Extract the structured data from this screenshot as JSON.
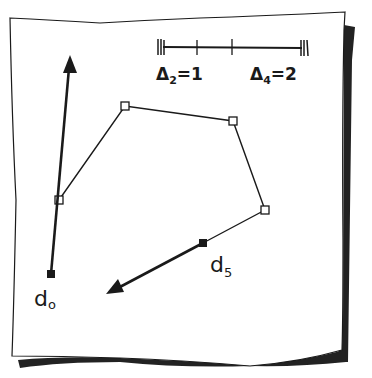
{
  "colors": {
    "ink": "#1a1a1a",
    "paper": "#ffffff",
    "shadow": "#222222"
  },
  "scale_bar": {
    "labels": [
      {
        "id": "delta2",
        "symbol": "Δ",
        "sub": "2",
        "eq": "=1",
        "x": 158,
        "y": 76
      },
      {
        "id": "delta4",
        "symbol": "Δ",
        "sub": "4",
        "eq": "=2",
        "x": 250,
        "y": 76
      }
    ],
    "x_start": 163,
    "x_end": 302,
    "y": 47,
    "ticks": [
      197,
      231
    ]
  },
  "polyline": {
    "control_points": [
      {
        "x": 59,
        "y": 200
      },
      {
        "x": 125,
        "y": 106
      },
      {
        "x": 233,
        "y": 121
      },
      {
        "x": 265,
        "y": 210
      }
    ]
  },
  "vectors": [
    {
      "id": "d0",
      "label": "d",
      "sub": "o",
      "from": {
        "x": 51,
        "y": 274
      },
      "to": {
        "x": 70,
        "y": 57
      },
      "label_pos": {
        "x": 36,
        "y": 305
      }
    },
    {
      "id": "d5",
      "label": "d",
      "sub": "5",
      "from": {
        "x": 203,
        "y": 243
      },
      "to": {
        "x": 108,
        "y": 293
      },
      "label_pos": {
        "x": 210,
        "y": 272
      }
    }
  ]
}
